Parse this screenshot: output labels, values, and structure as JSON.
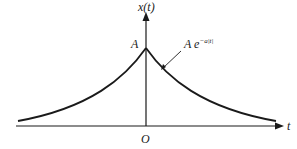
{
  "diagram": {
    "type": "two-sided exponential signal plot",
    "y_axis_label": "x(t)",
    "x_axis_label": "t",
    "origin_label": "O",
    "peak_label": "A",
    "curve_label_base": "A  e",
    "curve_label_exponent": "−a|t|",
    "colors": {
      "stroke": "#1a1a1a",
      "background": "#ffffff"
    }
  }
}
